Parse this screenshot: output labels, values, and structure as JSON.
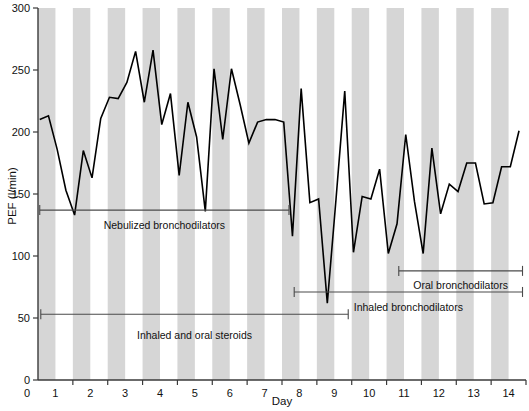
{
  "chart_data": {
    "type": "line",
    "title": "",
    "xlabel": "Day",
    "ylabel": "PEF (l/min)",
    "xlim": [
      0.5,
      14.5
    ],
    "ylim": [
      0,
      300
    ],
    "yticks": [
      0,
      50,
      100,
      150,
      200,
      250,
      300
    ],
    "xticks": [
      1,
      2,
      3,
      4,
      5,
      6,
      7,
      8,
      9,
      10,
      11,
      12,
      13,
      14
    ],
    "grid": false,
    "legend": "none",
    "background_bands": "alternating grey/white vertical bands, one half-day each (grey = night, white = day)",
    "series": [
      {
        "name": "PEF",
        "x": [
          0.55,
          0.8,
          1.05,
          1.3,
          1.55,
          1.8,
          2.05,
          2.3,
          2.55,
          2.8,
          3.05,
          3.3,
          3.55,
          3.8,
          4.05,
          4.3,
          4.55,
          4.8,
          5.05,
          5.3,
          5.55,
          5.8,
          6.05,
          6.3,
          6.55,
          6.8,
          7.05,
          7.3,
          7.55,
          7.8,
          8.05,
          8.3,
          8.55,
          8.8,
          9.05,
          9.3,
          9.55,
          9.8,
          10.05,
          10.3,
          10.55,
          10.8,
          11.05,
          11.3,
          11.55,
          11.8,
          12.05,
          12.3,
          12.55,
          12.8,
          13.05,
          13.3,
          13.55,
          13.8,
          14.05,
          14.3
        ],
        "y": [
          210,
          213,
          186,
          153,
          133,
          185,
          163,
          211,
          228,
          227,
          240,
          265,
          224,
          266,
          206,
          231,
          165,
          224,
          196,
          136,
          251,
          194,
          251,
          222,
          191,
          208,
          210,
          210,
          208,
          116,
          235,
          143,
          146,
          62,
          146,
          233,
          103,
          148,
          146,
          170,
          102,
          126,
          198,
          144,
          102,
          187,
          134,
          158,
          152,
          175,
          175,
          142,
          143,
          172,
          172,
          201
        ]
      }
    ],
    "annotations": [
      {
        "id": "nebulized-bronchodilators",
        "label": "Nebulized bronchodilators",
        "x_start": 0.55,
        "x_end": 7.7,
        "y": 137,
        "label_y": 122
      },
      {
        "id": "oral-bronchodilators",
        "label": "Oral bronchodilators",
        "x_start": 10.85,
        "x_end": 14.4,
        "y": 88,
        "label_y": 73
      },
      {
        "id": "inhaled-bronchodilators",
        "label": "Inhaled bronchodilators",
        "x_start": 7.85,
        "x_end": 14.4,
        "y": 71,
        "label_y": 56
      },
      {
        "id": "inhaled-and-oral-steroids",
        "label": "Inhaled and oral steroids",
        "x_start": 0.58,
        "x_end": 9.4,
        "y": 53,
        "label_y": 33
      }
    ]
  },
  "colors": {
    "band": "#d6d6d6",
    "line": "#000000",
    "axis": "#3a3a3a",
    "annotation": "#4a4a4a",
    "background": "#ffffff"
  }
}
